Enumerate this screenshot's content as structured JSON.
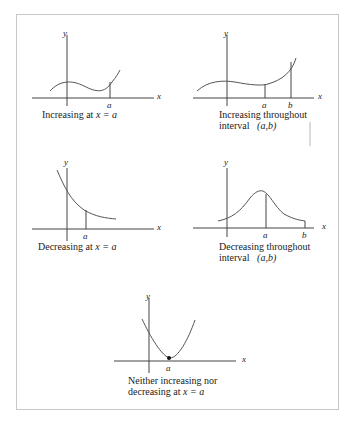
{
  "figure": {
    "panels": [
      {
        "id": "increasing-at-a",
        "caption_line1": "Increasing at",
        "caption_var": "x = a",
        "y_label": "y",
        "x_label": "x",
        "a_label": "a"
      },
      {
        "id": "increasing-interval",
        "caption_line1": "Increasing throughout",
        "caption_line2": "interval",
        "caption_var": "(a,b)",
        "y_label": "y",
        "x_label": "x",
        "a_label": "a",
        "b_label": "b"
      },
      {
        "id": "decreasing-at-a",
        "caption_line1": "Decreasing at",
        "caption_var": "x = a",
        "y_label": "y",
        "x_label": "x",
        "a_label": "a"
      },
      {
        "id": "decreasing-interval",
        "caption_line1": "Decreasing throughout",
        "caption_line2": "interval",
        "caption_var": "(a,b)",
        "y_label": "y",
        "x_label": "x",
        "a_label": "a",
        "b_label": "b"
      },
      {
        "id": "neither",
        "caption_line1": "Neither increasing nor",
        "caption_line2": "decreasing at",
        "caption_var": "x = a",
        "y_label": "y",
        "x_label": "x",
        "a_label": "a"
      }
    ]
  }
}
